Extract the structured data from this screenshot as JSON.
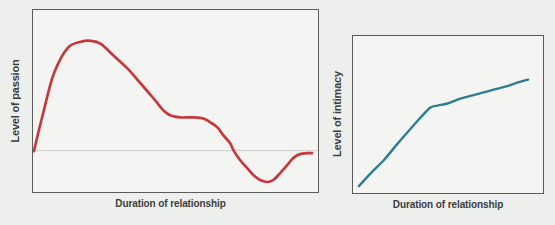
{
  "chart_data": [
    {
      "type": "line",
      "title": "",
      "xlabel": "Duration of relationship",
      "ylabel": "Level of passion",
      "x_axis": "qualitative, no tick marks, range 0-1 (normalized)",
      "y_axis": "qualitative, no tick marks, range 0-1 (normalized)",
      "grid": false,
      "legend": false,
      "baseline_y": 0.227,
      "baseline_color": "#c9cbc8",
      "border_color": "#5b5b5b",
      "series": [
        {
          "name": "passion",
          "color": "#c5383c",
          "width": 2.7,
          "x": [
            0.003,
            0.038,
            0.073,
            0.122,
            0.168,
            0.203,
            0.238,
            0.283,
            0.332,
            0.378,
            0.423,
            0.458,
            0.483,
            0.517,
            0.563,
            0.598,
            0.622,
            0.647,
            0.668,
            0.692,
            0.703,
            0.727,
            0.752,
            0.773,
            0.797,
            0.822,
            0.843,
            0.867,
            0.892,
            0.913,
            0.937,
            0.962,
            0.979
          ],
          "y": [
            0.224,
            0.448,
            0.65,
            0.792,
            0.825,
            0.831,
            0.814,
            0.749,
            0.678,
            0.596,
            0.514,
            0.448,
            0.421,
            0.41,
            0.41,
            0.404,
            0.383,
            0.355,
            0.311,
            0.268,
            0.23,
            0.175,
            0.131,
            0.093,
            0.066,
            0.055,
            0.066,
            0.104,
            0.148,
            0.186,
            0.208,
            0.213,
            0.213
          ]
        }
      ]
    },
    {
      "type": "line",
      "title": "",
      "xlabel": "Duration of relationship",
      "ylabel": "Level of intimacy",
      "x_axis": "qualitative, no tick marks, range 0-1 (normalized)",
      "y_axis": "qualitative, no tick marks, range 0-1 (normalized)",
      "grid": false,
      "legend": false,
      "border_color": "#5b5b5b",
      "series": [
        {
          "name": "intimacy",
          "color": "#2d7d91",
          "width": 2.4,
          "x": [
            0.031,
            0.094,
            0.162,
            0.236,
            0.304,
            0.356,
            0.408,
            0.445,
            0.497,
            0.565,
            0.644,
            0.723,
            0.801,
            0.864,
            0.921
          ],
          "y": [
            0.044,
            0.127,
            0.209,
            0.316,
            0.411,
            0.481,
            0.544,
            0.557,
            0.57,
            0.601,
            0.627,
            0.652,
            0.677,
            0.703,
            0.722
          ]
        }
      ]
    }
  ]
}
